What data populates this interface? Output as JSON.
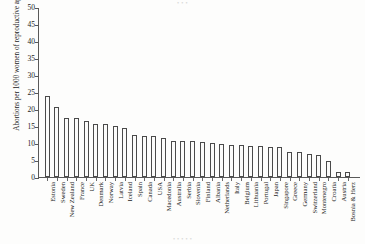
{
  "figure": {
    "artifact_top": "• • •",
    "artifact_bottom": "• • • • •"
  },
  "chart_data": {
    "type": "bar",
    "title": "",
    "xlabel": "",
    "ylabel": "Abortions per 1000 women of reproductive age",
    "ylim": [
      0,
      50
    ],
    "ytick_step": 5,
    "yticks": [
      0,
      5,
      10,
      15,
      20,
      25,
      30,
      35,
      40,
      45,
      50
    ],
    "ytick_labels": [
      "0",
      "5",
      "10",
      "15",
      "20",
      "25",
      "30",
      "35",
      "40",
      "45",
      "50"
    ],
    "grid": false,
    "legend": null,
    "bar_style": {
      "fill": "#fbfbfa",
      "edge": "#4a4a4a"
    },
    "categories": [
      "Estonia",
      "Sweden",
      "New Zealand",
      "France",
      "UK",
      "Denmark",
      "Norway",
      "Latvia",
      "Iceland",
      "Spain",
      "Canada",
      "USA",
      "Macedonia",
      "Australia",
      "Serbia",
      "Slovenia",
      "Finland",
      "Albania",
      "Netherlands",
      "Italy",
      "Belgium",
      "Lithuania",
      "Portugal",
      "Japan",
      "Singapore",
      "Greece",
      "Germany",
      "Switzerland",
      "Montenegro",
      "Croatia",
      "Austria",
      "Bosnia & Herz"
    ],
    "values": [
      23.7,
      20.7,
      17.4,
      17.3,
      16.6,
      15.6,
      15.5,
      15.1,
      14.5,
      12.4,
      12.1,
      12.1,
      11.5,
      10.6,
      10.5,
      10.5,
      10.4,
      10.0,
      9.7,
      9.4,
      9.4,
      9.2,
      9.1,
      8.9,
      8.8,
      7.4,
      7.3,
      6.9,
      6.5,
      4.6,
      1.5,
      1.4
    ]
  }
}
